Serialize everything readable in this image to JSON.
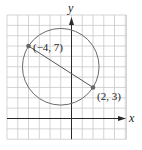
{
  "diagram": {
    "type": "coordinate-plane-circle",
    "axes": {
      "x_label": "x",
      "y_label": "y"
    },
    "grid": {
      "x_min": -6,
      "x_max": 5,
      "y_min": -2,
      "y_max": 10,
      "step": 1
    },
    "points": [
      {
        "x": -4,
        "y": 7,
        "label": "(−4, 7)"
      },
      {
        "x": 2,
        "y": 3,
        "label": "(2, 3)"
      }
    ],
    "segment": {
      "from": 0,
      "to": 1
    },
    "circle": {
      "center_x": -1,
      "center_y": 5
    },
    "colors": {
      "grid": "#c9c9c9",
      "axis": "#2a2a2a",
      "circle": "#6b6b6b",
      "segment": "#555555",
      "point": "#666666"
    }
  }
}
